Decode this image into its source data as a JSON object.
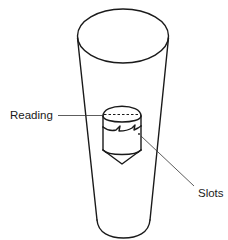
{
  "diagram": {
    "type": "rotameter-float-illustration",
    "cropped_caption": "",
    "labels": {
      "reading": "Reading",
      "slots": "Slots"
    },
    "components": [
      {
        "name": "tapered-tube",
        "description": "Transparent tapered tube, wide at top, narrow at bottom"
      },
      {
        "name": "float",
        "description": "Slotted float with conical bottom and flat top"
      },
      {
        "name": "reading-line",
        "description": "Dashed line across top edge of float marking the reading position"
      },
      {
        "name": "slots",
        "description": "Zigzag slots cut into the rim of the float"
      }
    ],
    "colors": {
      "line": "#1a1a1a",
      "background": "#ffffff"
    }
  }
}
